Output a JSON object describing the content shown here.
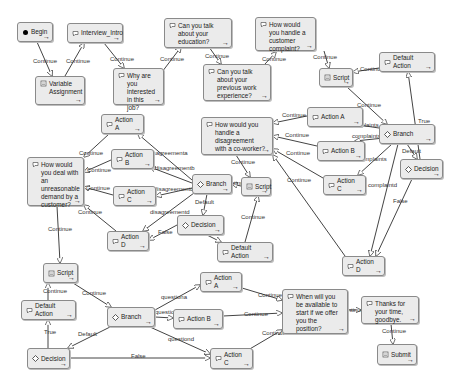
{
  "diagram": {
    "nodes": [
      {
        "id": "begin",
        "label": "Begin",
        "icon": "start-dot-icon",
        "x": 17,
        "y": 22,
        "w": 36,
        "h": 20
      },
      {
        "id": "interview_intro",
        "label": "Interview_Intro",
        "icon": "speech-icon",
        "x": 67,
        "y": 23,
        "w": 56,
        "h": 20
      },
      {
        "id": "variable_assignment",
        "label": "Variable Assignment",
        "icon": "variable-icon",
        "x": 35,
        "y": 76,
        "w": 50,
        "h": 29
      },
      {
        "id": "why_interested",
        "label": "Why are you interested in this job?",
        "icon": "speech-icon",
        "x": 113,
        "y": 68,
        "w": 51,
        "h": 37
      },
      {
        "id": "talk_education",
        "label": "Can you talk about your education?",
        "icon": "speech-icon",
        "x": 164,
        "y": 18,
        "w": 68,
        "h": 30
      },
      {
        "id": "talk_work",
        "label": "Can you talk about your previous work experience?",
        "icon": "speech-icon",
        "x": 203,
        "y": 64,
        "w": 68,
        "h": 37
      },
      {
        "id": "customer_complaint",
        "label": "How would you handle a customer complaint?",
        "icon": "speech-icon",
        "x": 255,
        "y": 17,
        "w": 61,
        "h": 34
      },
      {
        "id": "script_1",
        "label": "Script",
        "icon": "script-icon",
        "x": 319,
        "y": 68,
        "w": 34,
        "h": 19
      },
      {
        "id": "default_action_1",
        "label": "Default Action",
        "icon": "speech-icon",
        "x": 379,
        "y": 52,
        "w": 56,
        "h": 20
      },
      {
        "id": "action_a_1",
        "label": "Action A",
        "icon": "speech-icon",
        "x": 307,
        "y": 107,
        "w": 56,
        "h": 20
      },
      {
        "id": "branch_1",
        "label": "Branch",
        "icon": "branch-icon",
        "x": 379,
        "y": 124,
        "w": 56,
        "h": 20
      },
      {
        "id": "action_b_1",
        "label": "Action B",
        "icon": "speech-icon",
        "x": 317,
        "y": 141,
        "w": 48,
        "h": 20
      },
      {
        "id": "decision_1",
        "label": "Decision",
        "icon": "decision-icon",
        "x": 400,
        "y": 159,
        "w": 43,
        "h": 20
      },
      {
        "id": "action_c_1",
        "label": "Action C",
        "icon": "speech-icon",
        "x": 323,
        "y": 175,
        "w": 43,
        "h": 20
      },
      {
        "id": "action_d_1",
        "label": "Action D",
        "icon": "speech-icon",
        "x": 342,
        "y": 256,
        "w": 43,
        "h": 20
      },
      {
        "id": "coworker_disagreement",
        "label": "How would you handle a disagreement with a co-worker?",
        "icon": "speech-icon",
        "x": 201,
        "y": 117,
        "w": 72,
        "h": 38
      },
      {
        "id": "script_2",
        "label": "Script",
        "icon": "script-icon",
        "x": 241,
        "y": 177,
        "w": 30,
        "h": 19
      },
      {
        "id": "branch_2",
        "label": "Branch",
        "icon": "branch-icon",
        "x": 192,
        "y": 174,
        "w": 40,
        "h": 20
      },
      {
        "id": "default_action_2",
        "label": "Default Action",
        "icon": "speech-icon",
        "x": 217,
        "y": 242,
        "w": 56,
        "h": 20
      },
      {
        "id": "decision_2",
        "label": "Decision",
        "icon": "decision-icon",
        "x": 177,
        "y": 215,
        "w": 47,
        "h": 20
      },
      {
        "id": "action_a_2",
        "label": "Action A",
        "icon": "speech-icon",
        "x": 101,
        "y": 114,
        "w": 43,
        "h": 20
      },
      {
        "id": "action_b_2",
        "label": "Action B",
        "icon": "speech-icon",
        "x": 111,
        "y": 149,
        "w": 43,
        "h": 20
      },
      {
        "id": "action_c_2",
        "label": "Action C",
        "icon": "speech-icon",
        "x": 113,
        "y": 186,
        "w": 43,
        "h": 20
      },
      {
        "id": "action_d_2",
        "label": "Action D",
        "icon": "speech-icon",
        "x": 107,
        "y": 231,
        "w": 42,
        "h": 20
      },
      {
        "id": "unreasonable_demand",
        "label": "How would you deal with an unreasonable demand by a customer?",
        "icon": "speech-icon",
        "x": 27,
        "y": 157,
        "w": 57,
        "h": 49
      },
      {
        "id": "script_3",
        "label": "Script",
        "icon": "script-icon",
        "x": 43,
        "y": 263,
        "w": 35,
        "h": 20
      },
      {
        "id": "default_action_3",
        "label": "Default Action",
        "icon": "speech-icon",
        "x": 21,
        "y": 300,
        "w": 55,
        "h": 20
      },
      {
        "id": "decision_3",
        "label": "Decision",
        "icon": "decision-icon",
        "x": 27,
        "y": 348,
        "w": 43,
        "h": 21
      },
      {
        "id": "branch_3",
        "label": "Branch",
        "icon": "branch-icon",
        "x": 107,
        "y": 307,
        "w": 48,
        "h": 20
      },
      {
        "id": "action_a_3",
        "label": "Action A",
        "icon": "speech-icon",
        "x": 200,
        "y": 272,
        "w": 42,
        "h": 20
      },
      {
        "id": "action_b_3",
        "label": "Action B",
        "icon": "speech-icon",
        "x": 173,
        "y": 309,
        "w": 50,
        "h": 20
      },
      {
        "id": "action_c_3",
        "label": "Action C",
        "icon": "speech-icon",
        "x": 210,
        "y": 348,
        "w": 43,
        "h": 21
      },
      {
        "id": "available_start",
        "label": "When will you be available to start if we offer you the position?",
        "icon": "speech-icon",
        "x": 282,
        "y": 289,
        "w": 66,
        "h": 45
      },
      {
        "id": "thanks_goodbye",
        "label": "Thanks for your time, goodbye.",
        "icon": "speech-icon",
        "x": 361,
        "y": 296,
        "w": 58,
        "h": 28
      },
      {
        "id": "submit",
        "label": "Submit",
        "icon": "submit-icon",
        "x": 377,
        "y": 344,
        "w": 40,
        "h": 21
      }
    ],
    "edges": [
      {
        "from": [
          37,
          42
        ],
        "to": [
          52,
          76
        ],
        "label": "Continue",
        "lx": 33,
        "ly": 63
      },
      {
        "from": [
          65,
          76
        ],
        "to": [
          84,
          43
        ],
        "label": "Continue",
        "lx": 66,
        "ly": 63
      },
      {
        "from": [
          104,
          43
        ],
        "to": [
          124,
          68
        ],
        "label": "Continue",
        "lx": 110,
        "ly": 61
      },
      {
        "from": [
          162,
          72
        ],
        "to": [
          181,
          47
        ],
        "label": "Continue",
        "lx": 160,
        "ly": 61
      },
      {
        "from": [
          209,
          47
        ],
        "to": [
          221,
          64
        ],
        "label": "Continue",
        "lx": 205,
        "ly": 58
      },
      {
        "from": [
          265,
          64
        ],
        "to": [
          276,
          52
        ],
        "label": "Continue",
        "lx": 262,
        "ly": 61
      },
      {
        "from": [
          324,
          51
        ],
        "to": [
          329,
          68
        ],
        "label": "Continue",
        "lx": 313,
        "ly": 59
      },
      {
        "from": [
          379,
          68
        ],
        "to": [
          353,
          72
        ],
        "label": "Continue",
        "lx": 360,
        "ly": 71
      },
      {
        "from": [
          347,
          87
        ],
        "to": [
          387,
          124
        ],
        "label": "Continue",
        "lx": 357,
        "ly": 107
      },
      {
        "from": [
          407,
          144
        ],
        "to": [
          417,
          159
        ],
        "label": "Default",
        "lx": 402,
        "ly": 153
      },
      {
        "from": [
          420,
          159
        ],
        "to": [
          408,
          72
        ],
        "label": "True",
        "lx": 418,
        "ly": 123
      },
      {
        "from": [
          379,
          128
        ],
        "to": [
          352,
          124
        ],
        "label": "complaints",
        "lx": 350,
        "ly": 127
      },
      {
        "from": [
          384,
          138
        ],
        "to": [
          355,
          141
        ],
        "label": "complaints",
        "lx": 352,
        "ly": 138
      },
      {
        "from": [
          392,
          144
        ],
        "to": [
          358,
          175
        ],
        "label": "complaints",
        "lx": 358,
        "ly": 161
      },
      {
        "from": [
          398,
          144
        ],
        "to": [
          370,
          256
        ],
        "label": "complaintd",
        "lx": 368,
        "ly": 187
      },
      {
        "from": [
          412,
          179
        ],
        "to": [
          376,
          256
        ],
        "label": "False",
        "lx": 393,
        "ly": 203
      },
      {
        "from": [
          307,
          116
        ],
        "to": [
          273,
          123
        ],
        "label": "Continue",
        "lx": 282,
        "ly": 117
      },
      {
        "from": [
          317,
          146
        ],
        "to": [
          273,
          136
        ],
        "label": "Continue",
        "lx": 285,
        "ly": 137
      },
      {
        "from": [
          323,
          178
        ],
        "to": [
          273,
          149
        ],
        "label": "Continue",
        "lx": 286,
        "ly": 155
      },
      {
        "from": [
          345,
          256
        ],
        "to": [
          273,
          155
        ],
        "label": "Continue",
        "lx": 287,
        "ly": 182
      },
      {
        "from": [
          236,
          155
        ],
        "to": [
          250,
          177
        ],
        "label": "Continue",
        "lx": 231,
        "ly": 164
      },
      {
        "from": [
          241,
          186
        ],
        "to": [
          232,
          184
        ],
        "label": "Continue",
        "lx": 223,
        "ly": 185
      },
      {
        "from": [
          245,
          242
        ],
        "to": [
          258,
          196
        ],
        "label": "Continue",
        "lx": 241,
        "ly": 219
      },
      {
        "from": [
          207,
          194
        ],
        "to": [
          203,
          215
        ],
        "label": "Default",
        "lx": 195,
        "ly": 204
      },
      {
        "from": [
          207,
          235
        ],
        "to": [
          221,
          242
        ],
        "label": "",
        "lx": 0,
        "ly": 0
      },
      {
        "from": [
          192,
          180
        ],
        "to": [
          138,
          134
        ],
        "label": "disagreementa",
        "lx": 148,
        "ly": 155
      },
      {
        "from": [
          192,
          183
        ],
        "to": [
          150,
          167
        ],
        "label": "disagreementb",
        "lx": 155,
        "ly": 170
      },
      {
        "from": [
          192,
          188
        ],
        "to": [
          156,
          196
        ],
        "label": "disagreementc",
        "lx": 154,
        "ly": 191
      },
      {
        "from": [
          194,
          193
        ],
        "to": [
          143,
          231
        ],
        "label": "disagreementd",
        "lx": 150,
        "ly": 214
      },
      {
        "from": [
          177,
          225
        ],
        "to": [
          149,
          240
        ],
        "label": "False",
        "lx": 158,
        "ly": 234
      },
      {
        "from": [
          109,
          134
        ],
        "to": [
          84,
          157
        ],
        "label": "Continue",
        "lx": 79,
        "ly": 155
      },
      {
        "from": [
          111,
          160
        ],
        "to": [
          84,
          172
        ],
        "label": "Continue",
        "lx": 87,
        "ly": 172
      },
      {
        "from": [
          113,
          195
        ],
        "to": [
          84,
          187
        ],
        "label": "Continue",
        "lx": 86,
        "ly": 190
      },
      {
        "from": [
          116,
          231
        ],
        "to": [
          84,
          205
        ],
        "label": "Continue",
        "lx": 78,
        "ly": 214
      },
      {
        "from": [
          57,
          206
        ],
        "to": [
          60,
          263
        ],
        "label": "Continue",
        "lx": 48,
        "ly": 231
      },
      {
        "from": [
          73,
          283
        ],
        "to": [
          111,
          307
        ],
        "label": "Continue",
        "lx": 82,
        "ly": 295
      },
      {
        "from": [
          48,
          300
        ],
        "to": [
          48,
          283
        ],
        "label": "Continue",
        "lx": 43,
        "ly": 293
      },
      {
        "from": [
          48,
          348
        ],
        "to": [
          48,
          320
        ],
        "label": "True",
        "lx": 44,
        "ly": 334
      },
      {
        "from": [
          110,
          327
        ],
        "to": [
          68,
          348
        ],
        "label": "Default",
        "lx": 78,
        "ly": 336
      },
      {
        "from": [
          70,
          358
        ],
        "to": [
          210,
          358
        ],
        "label": "False",
        "lx": 131,
        "ly": 358
      },
      {
        "from": [
          155,
          310
        ],
        "to": [
          200,
          285
        ],
        "label": "questiona",
        "lx": 161,
        "ly": 299
      },
      {
        "from": [
          155,
          317
        ],
        "to": [
          173,
          318
        ],
        "label": "questionb",
        "lx": 155,
        "ly": 314
      },
      {
        "from": [
          150,
          327
        ],
        "to": [
          210,
          354
        ],
        "label": "questiond",
        "lx": 168,
        "ly": 341
      },
      {
        "from": [
          242,
          288
        ],
        "to": [
          282,
          300
        ],
        "label": "Continue",
        "lx": 258,
        "ly": 297
      },
      {
        "from": [
          223,
          316
        ],
        "to": [
          282,
          313
        ],
        "label": "Continue",
        "lx": 244,
        "ly": 316
      },
      {
        "from": [
          248,
          350
        ],
        "to": [
          282,
          330
        ],
        "label": "Continue",
        "lx": 262,
        "ly": 335
      },
      {
        "from": [
          348,
          310
        ],
        "to": [
          361,
          310
        ],
        "label": "Continue",
        "lx": 340,
        "ly": 312
      },
      {
        "from": [
          391,
          324
        ],
        "to": [
          393,
          344
        ],
        "label": "Continue",
        "lx": 382,
        "ly": 333
      }
    ]
  }
}
